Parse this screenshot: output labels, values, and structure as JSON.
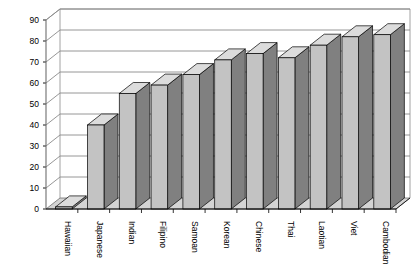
{
  "chart_data": {
    "type": "bar",
    "title": "",
    "subtitle": "",
    "xlabel": "",
    "ylabel": "",
    "style": "3d-column",
    "grid": true,
    "legend": false,
    "legend_position": "none",
    "ylim": [
      0,
      90
    ],
    "ytick_step": 10,
    "yticks": [
      "0",
      "10",
      "20",
      "30",
      "40",
      "50",
      "60",
      "70",
      "80",
      "90"
    ],
    "categories": [
      "Hawaiian",
      "Japanese",
      "Indian",
      "Filipino",
      "Samoan",
      "Korean",
      "Chinese",
      "Thai",
      "Laotian",
      "Viet",
      "Cambodian"
    ],
    "values": [
      1,
      40,
      55,
      59,
      64,
      71,
      74,
      72,
      78,
      82,
      83
    ],
    "colors": {
      "bar_front": "#c3c3c3",
      "bar_side": "#808080",
      "bar_top": "#dcdcdc",
      "bar_outline": "#000000",
      "gridline": "#8a8a8a",
      "axis": "#6e6e6e",
      "background": "#ffffff"
    }
  }
}
